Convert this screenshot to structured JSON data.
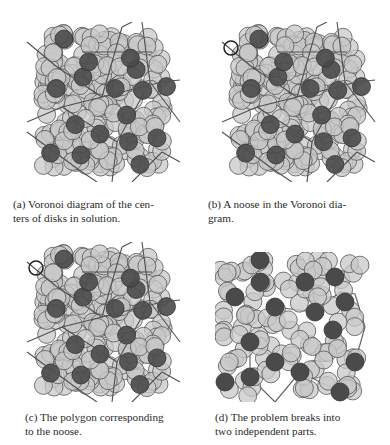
{
  "figure": {
    "panels": [
      {
        "id": "a",
        "label": "(a)",
        "caption": "(a) Voronoi diagram of the centers of disks in solution.",
        "caption_lines": [
          "(a) Voronoi diagram of the cen-",
          "ters of disks in solution."
        ]
      },
      {
        "id": "b",
        "label": "(b)",
        "caption": "(b) A noose in the Voronoi diagram.",
        "caption_lines": [
          "(b) A noose in the Voronoi dia-",
          "gram."
        ]
      },
      {
        "id": "c",
        "label": "(c)",
        "caption": "(c) The polygon corresponding to the noose.",
        "caption_lines": [
          "(c) The polygon corresponding",
          "to the noose."
        ]
      },
      {
        "id": "d",
        "label": "(d)",
        "caption": "(d) The problem breaks into two independent parts.",
        "caption_lines": [
          "(d) The problem breaks into",
          "two independent parts."
        ]
      }
    ],
    "colors": {
      "light_disk": "#c8c8c8",
      "dark_disk": "#4a4a4a",
      "disk_stroke": "#555555",
      "voronoi_edge": "#505050"
    }
  }
}
